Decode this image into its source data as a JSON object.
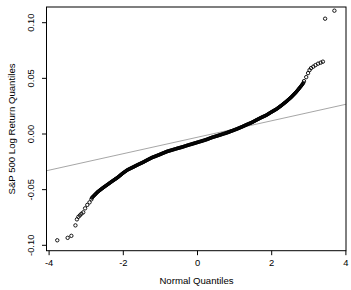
{
  "figure": {
    "background": "#ffffff"
  },
  "chart_data": {
    "type": "scatter",
    "subtype": "qq-plot",
    "title": "",
    "xlabel": "Normal Quantiles",
    "ylabel": "S&P 500  Log Return Quantiles",
    "x_ticks": [
      -4,
      -2,
      0,
      2,
      4
    ],
    "x_tick_labels": [
      "-4",
      "-2",
      "0",
      "2",
      "4"
    ],
    "y_ticks": [
      -0.1,
      -0.05,
      0.0,
      0.05,
      0.1
    ],
    "y_tick_labels": [
      "-0.10",
      "-0.05",
      "0.00",
      "0.05",
      "0.10"
    ],
    "xlim": [
      -4.07,
      4.0
    ],
    "ylim": [
      -0.105,
      0.114
    ],
    "grid": false,
    "legend": "none",
    "marker": "open-circle",
    "colors": {
      "points": "#000000",
      "reference_line": "#8f8f8f",
      "axis": "#000000",
      "text": "#000000",
      "background": "#ffffff"
    },
    "reference_line": {
      "slope": 0.0074,
      "intercept": -0.0029,
      "q_start": -4.07,
      "q_end": 4.0
    },
    "lower_tail_points": [
      [
        -3.78,
        -0.0955
      ],
      [
        -3.5,
        -0.0933
      ],
      [
        -3.4,
        -0.0915
      ],
      [
        -3.29,
        -0.0821
      ],
      [
        -3.25,
        -0.0767
      ],
      [
        -3.21,
        -0.0744
      ],
      [
        -3.17,
        -0.0731
      ],
      [
        -3.13,
        -0.0717
      ],
      [
        -3.08,
        -0.0704
      ],
      [
        -3.03,
        -0.0668
      ],
      [
        -2.97,
        -0.0637
      ],
      [
        -2.91,
        -0.0614
      ],
      [
        -2.86,
        -0.0587
      ]
    ],
    "dense_curve_points": [
      [
        -2.85,
        -0.0574
      ],
      [
        -2.69,
        -0.052
      ],
      [
        -2.55,
        -0.0484
      ],
      [
        -2.42,
        -0.0453
      ],
      [
        -2.29,
        -0.0422
      ],
      [
        -2.15,
        -0.039
      ],
      [
        -2.02,
        -0.0354
      ],
      [
        -1.89,
        -0.0323
      ],
      [
        -1.75,
        -0.03
      ],
      [
        -1.62,
        -0.0278
      ],
      [
        -1.48,
        -0.0256
      ],
      [
        -1.35,
        -0.0233
      ],
      [
        -1.22,
        -0.0211
      ],
      [
        -1.08,
        -0.0193
      ],
      [
        -0.95,
        -0.0175
      ],
      [
        -0.82,
        -0.0157
      ],
      [
        -0.68,
        -0.0143
      ],
      [
        -0.55,
        -0.013
      ],
      [
        -0.41,
        -0.0117
      ],
      [
        -0.28,
        -0.0103
      ],
      [
        -0.15,
        -0.009
      ],
      [
        -0.01,
        -0.0076
      ],
      [
        0.12,
        -0.0063
      ],
      [
        0.25,
        -0.0049
      ],
      [
        0.39,
        -0.0031
      ],
      [
        0.52,
        -0.0018
      ],
      [
        0.66,
        -0.0003
      ],
      [
        0.79,
        0.0011
      ],
      [
        0.92,
        0.0027
      ],
      [
        1.06,
        0.0045
      ],
      [
        1.19,
        0.0063
      ],
      [
        1.32,
        0.0083
      ],
      [
        1.46,
        0.0103
      ],
      [
        1.59,
        0.0126
      ],
      [
        1.72,
        0.0148
      ],
      [
        1.86,
        0.017
      ],
      [
        1.99,
        0.0197
      ],
      [
        2.13,
        0.0224
      ],
      [
        2.26,
        0.0256
      ],
      [
        2.39,
        0.0291
      ],
      [
        2.53,
        0.0332
      ],
      [
        2.66,
        0.0377
      ],
      [
        2.79,
        0.043
      ],
      [
        2.87,
        0.0466
      ]
    ],
    "upper_tail_points": [
      [
        2.87,
        0.0475
      ],
      [
        2.93,
        0.0511
      ],
      [
        2.98,
        0.0547
      ],
      [
        3.02,
        0.0574
      ],
      [
        3.06,
        0.0592
      ],
      [
        3.12,
        0.0605
      ],
      [
        3.18,
        0.0619
      ],
      [
        3.25,
        0.0632
      ],
      [
        3.32,
        0.0641
      ],
      [
        3.38,
        0.065
      ],
      [
        3.44,
        0.1036
      ],
      [
        3.69,
        0.1108
      ]
    ]
  }
}
